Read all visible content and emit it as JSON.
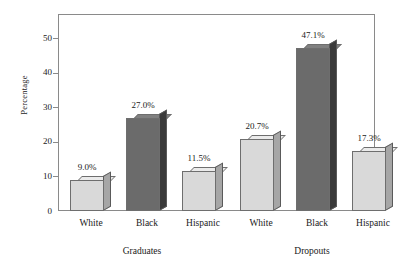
{
  "chart_data": {
    "type": "bar",
    "title": "",
    "subtitle": "",
    "xlabel": "",
    "ylabel": "Percentage",
    "ylim": [
      0,
      57
    ],
    "yticks": [
      0,
      10,
      20,
      30,
      40,
      50
    ],
    "ytick_labels": [
      "0",
      "10",
      "20",
      "30",
      "40",
      "50"
    ],
    "grid": false,
    "legend": "none",
    "group_labels": [
      "Graduates",
      "Dropouts"
    ],
    "categories": [
      "White",
      "Black",
      "Hispanic",
      "White",
      "Black",
      "Hispanic"
    ],
    "values": [
      9.0,
      27.0,
      11.5,
      20.7,
      47.1,
      17.3
    ],
    "value_labels": [
      "9.0%",
      "27.0%",
      "11.5%",
      "20.7%",
      "47.1%",
      "17.3%"
    ],
    "groups": [
      {
        "name": "Graduates",
        "bars": [
          {
            "category": "White",
            "value": 9.0,
            "label": "9.0%",
            "shade": "light"
          },
          {
            "category": "Black",
            "value": 27.0,
            "label": "27.0%",
            "shade": "dark"
          },
          {
            "category": "Hispanic",
            "value": 11.5,
            "label": "11.5%",
            "shade": "light"
          }
        ]
      },
      {
        "name": "Dropouts",
        "bars": [
          {
            "category": "White",
            "value": 20.7,
            "label": "20.7%",
            "shade": "light"
          },
          {
            "category": "Black",
            "value": 47.1,
            "label": "47.1%",
            "shade": "dark"
          },
          {
            "category": "Hispanic",
            "value": 17.3,
            "label": "17.3%",
            "shade": "light"
          }
        ]
      }
    ],
    "colors": {
      "bar_light_front": "#d9d9d9",
      "bar_light_side": "#a6a6a6",
      "bar_light_top": "#ebebeb",
      "bar_dark_front": "#6b6b6b",
      "bar_dark_side": "#3a3a3a",
      "bar_dark_top": "#808080",
      "axis": "#8a8a8a",
      "text": "#1a1a1a",
      "background": "#ffffff"
    }
  }
}
